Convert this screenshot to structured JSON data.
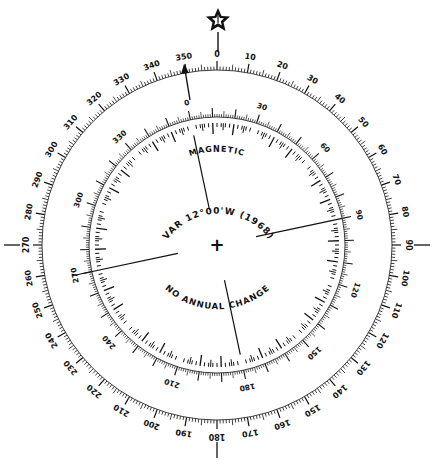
{
  "diagram": {
    "colors": {
      "ink": "#111111",
      "background": "#ffffff"
    },
    "center": {
      "x": 217,
      "y": 245
    },
    "true_ring": {
      "name": "true",
      "radius": 175,
      "rotation_deg": 0,
      "label_step": 10,
      "labels": [
        "0",
        "10",
        "20",
        "30",
        "40",
        "50",
        "60",
        "70",
        "80",
        "90",
        "100",
        "110",
        "120",
        "130",
        "140",
        "150",
        "160",
        "170",
        "180",
        "190",
        "200",
        "210",
        "220",
        "230",
        "240",
        "250",
        "260",
        "270",
        "280",
        "290",
        "300",
        "310",
        "320",
        "330",
        "340",
        "350"
      ],
      "ticks_outward": true,
      "cardinal_marks": [
        "0",
        "90",
        "180",
        "270"
      ]
    },
    "magnetic_ring": {
      "name": "magnetic",
      "radius": 128,
      "rotation_deg": -12,
      "label_step": 30,
      "labels": [
        "0",
        "30",
        "60",
        "90",
        "120",
        "150",
        "180",
        "210",
        "240",
        "270",
        "300",
        "330"
      ],
      "ticks_outward": true,
      "inner_point_ticks": true
    },
    "true_north_symbol": "star-icon",
    "magnetic_north_arrow": "arrow-icon",
    "text": {
      "magnetic": "MAGNETIC",
      "variation": "VAR 12°00'W (1968)",
      "annual_change": "NO ANNUAL CHANGE"
    },
    "center_mark": "+"
  }
}
